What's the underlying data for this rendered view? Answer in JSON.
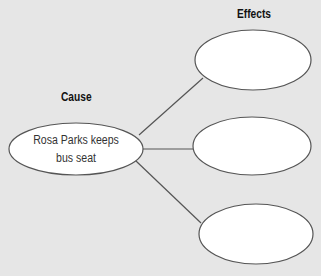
{
  "diagram": {
    "type": "cause-effect",
    "cause_heading": "Cause",
    "effects_heading": "Effects",
    "cause": {
      "line1": "Rosa Parks keeps",
      "line2": "bus seat"
    },
    "effects": [
      {
        "label": ""
      },
      {
        "label": ""
      },
      {
        "label": ""
      }
    ],
    "colors": {
      "background": "#e6e6e6",
      "shape_fill": "#ffffff",
      "stroke": "#555555"
    }
  }
}
